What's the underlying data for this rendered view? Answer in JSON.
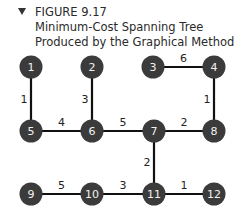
{
  "caption": {
    "icon": "triangle-down-icon",
    "line1": "FIGURE 9.17",
    "line2": "Minimum-Cost Spanning Tree",
    "line3": "Produced by the Graphical Method"
  },
  "graph": {
    "nodes": [
      {
        "id": "1",
        "label": "1",
        "x": 31,
        "y": 67
      },
      {
        "id": "2",
        "label": "2",
        "x": 92,
        "y": 67
      },
      {
        "id": "3",
        "label": "3",
        "x": 153,
        "y": 67
      },
      {
        "id": "4",
        "label": "4",
        "x": 214,
        "y": 67
      },
      {
        "id": "5",
        "label": "5",
        "x": 31,
        "y": 131
      },
      {
        "id": "6",
        "label": "6",
        "x": 92,
        "y": 131
      },
      {
        "id": "7",
        "label": "7",
        "x": 154,
        "y": 131
      },
      {
        "id": "8",
        "label": "8",
        "x": 214,
        "y": 131
      },
      {
        "id": "9",
        "label": "9",
        "x": 31,
        "y": 194
      },
      {
        "id": "10",
        "label": "10",
        "x": 92,
        "y": 194
      },
      {
        "id": "11",
        "label": "11",
        "x": 154,
        "y": 194
      },
      {
        "id": "12",
        "label": "12",
        "x": 214,
        "y": 194
      }
    ],
    "edges": [
      {
        "from": "1",
        "to": "5",
        "weight": "1"
      },
      {
        "from": "2",
        "to": "6",
        "weight": "3"
      },
      {
        "from": "3",
        "to": "4",
        "weight": "6"
      },
      {
        "from": "4",
        "to": "8",
        "weight": "1"
      },
      {
        "from": "5",
        "to": "6",
        "weight": "4"
      },
      {
        "from": "6",
        "to": "7",
        "weight": "5"
      },
      {
        "from": "7",
        "to": "8",
        "weight": "2"
      },
      {
        "from": "7",
        "to": "11",
        "weight": "2"
      },
      {
        "from": "9",
        "to": "10",
        "weight": "5"
      },
      {
        "from": "10",
        "to": "11",
        "weight": "3"
      },
      {
        "from": "11",
        "to": "12",
        "weight": "1"
      }
    ]
  }
}
